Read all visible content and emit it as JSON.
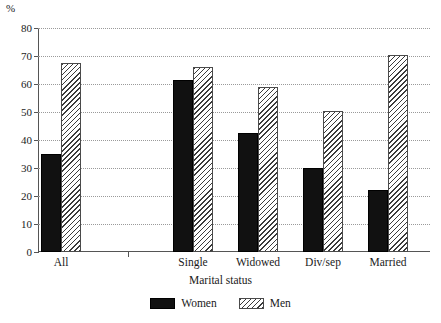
{
  "chart_data": {
    "type": "bar",
    "title": "",
    "subtitle": "",
    "xlabel": "Marital status",
    "ylabel": "%",
    "categories": [
      "All",
      "Single",
      "Widowed",
      "Div/sep",
      "Married"
    ],
    "series": [
      {
        "name": "Women",
        "values": [
          35,
          61.5,
          42.5,
          30,
          22
        ],
        "color": "#111111",
        "pattern": "solid"
      },
      {
        "name": "Men",
        "values": [
          67.5,
          66,
          59,
          50.5,
          70.5
        ],
        "color": "#3b3b3b",
        "pattern": "diagonal-hatch"
      }
    ],
    "ylim": [
      0,
      80
    ],
    "yticks": [
      0,
      10,
      20,
      30,
      40,
      50,
      60,
      70,
      80
    ],
    "ytick_labels": [
      "0",
      "10",
      "20",
      "30",
      "40",
      "50",
      "60",
      "70",
      "80"
    ],
    "grid": "horizontal-dotted",
    "legend_position": "bottom-center"
  },
  "axis": {
    "y_unit": "%",
    "x_title": "Marital status"
  },
  "legend": {
    "items": [
      {
        "label": "Women",
        "swatch": "solid-black-swatch"
      },
      {
        "label": "Men",
        "swatch": "hatched-swatch"
      }
    ]
  }
}
